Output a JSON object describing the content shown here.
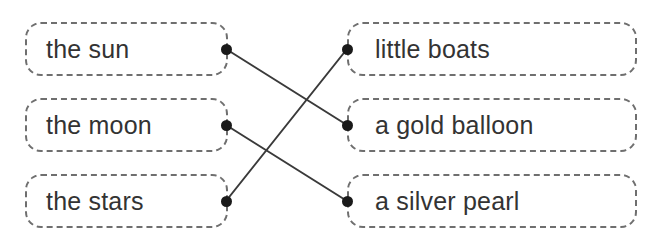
{
  "exercise": {
    "type": "matching",
    "title": "Match the phrases",
    "colors": {
      "box_border": "#6f6f6f",
      "text": "#333333",
      "dot": "#1a1a1a",
      "line": "#3a3a3a",
      "background": "#ffffff"
    },
    "left_column": [
      {
        "id": "left-1",
        "label": "the sun",
        "anchor": {
          "x": 226,
          "y": 49
        }
      },
      {
        "id": "left-2",
        "label": "the moon",
        "anchor": {
          "x": 226,
          "y": 125
        }
      },
      {
        "id": "left-3",
        "label": "the stars",
        "anchor": {
          "x": 226,
          "y": 201
        }
      }
    ],
    "right_column": [
      {
        "id": "right-1",
        "label": "little boats",
        "anchor": {
          "x": 347,
          "y": 49
        }
      },
      {
        "id": "right-2",
        "label": "a gold balloon",
        "anchor": {
          "x": 347,
          "y": 125
        }
      },
      {
        "id": "right-3",
        "label": "a silver pearl",
        "anchor": {
          "x": 347,
          "y": 201
        }
      }
    ],
    "connections": [
      {
        "id": "conn-1",
        "from": "left-1",
        "to": "right-2",
        "from_label": "the sun",
        "to_label": "a gold balloon"
      },
      {
        "id": "conn-2",
        "from": "left-2",
        "to": "right-3",
        "from_label": "the moon",
        "to_label": "a silver pearl"
      },
      {
        "id": "conn-3",
        "from": "left-3",
        "to": "right-1",
        "from_label": "the stars",
        "to_label": "little boats"
      }
    ]
  }
}
